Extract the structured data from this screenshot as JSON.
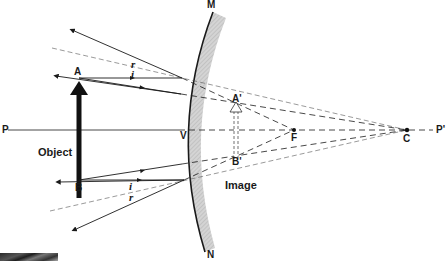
{
  "diagram": {
    "colors": {
      "ink": "#1a1a1a",
      "mirror_back": "#c8c8c8",
      "dashed": "#555555"
    },
    "labels": {
      "P": "P",
      "P_prime": "P'",
      "M": "M",
      "N": "N",
      "V": "V",
      "F": "F",
      "C": "C",
      "A": "A",
      "B": "B",
      "A_prime": "A'",
      "B_prime": "B'",
      "r_top": "r",
      "i_top": "i",
      "i_bottom": "i",
      "r_bottom": "r",
      "object": "Object",
      "image": "Image"
    }
  }
}
